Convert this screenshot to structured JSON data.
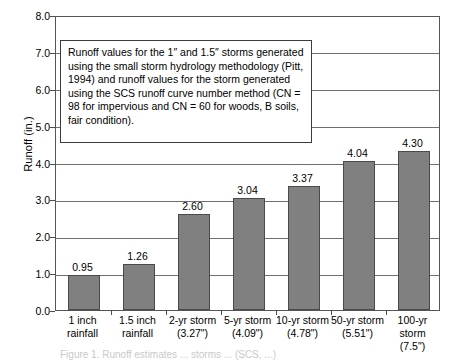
{
  "chart_data": {
    "type": "bar",
    "title": "",
    "xlabel": "",
    "ylabel": "Runoff (in.)",
    "ylim": [
      0,
      8
    ],
    "ytick_step": 1,
    "grid": true,
    "legend": "none",
    "bar_color": "#808080",
    "bar_edge_color": "#4a4a4a",
    "axis_color": "#555555",
    "categories": [
      "1 inch rainfall",
      "1.5 inch rainfall",
      "2-yr storm (3.27\")",
      "5-yr storm (4.09\")",
      "10-yr storm (4.78\")",
      "50-yr storm (5.51\")",
      "100-yr storm (7.5\")"
    ],
    "category_lines": [
      [
        "1 inch",
        "rainfall"
      ],
      [
        "1.5 inch",
        "rainfall"
      ],
      [
        "2-yr storm",
        "(3.27\")"
      ],
      [
        "5-yr storm",
        "(4.09\")"
      ],
      [
        "10-yr storm",
        "(4.78\")"
      ],
      [
        "50-yr storm",
        "(5.51\")"
      ],
      [
        "100-yr storm",
        "(7.5\")"
      ]
    ],
    "values": [
      0.95,
      1.26,
      2.6,
      3.04,
      3.37,
      4.04,
      4.3
    ],
    "value_labels": [
      "0.95",
      "1.26",
      "2.60",
      "3.04",
      "3.37",
      "4.04",
      "4.30"
    ],
    "ytick_labels": [
      "8.0",
      "7.0",
      "6.0",
      "5.0",
      "4.0",
      "3.0",
      "2.0",
      "1.0",
      "0.0"
    ],
    "ytick_values": [
      8,
      7,
      6,
      5,
      4,
      3,
      2,
      1,
      0
    ]
  },
  "annotation": {
    "text": "Runoff values for the 1″ and 1.5″ storms generated using the small storm hydrology methodology (Pitt, 1994) and runoff values for the storm generated using the SCS runoff curve number method (CN = 98 for impervious and CN = 60 for woods, B soils, fair condition)."
  },
  "bottom_caption": {
    "text": "Figure 1. Runoff estimates ... storms ...  (SCS, ...)"
  }
}
